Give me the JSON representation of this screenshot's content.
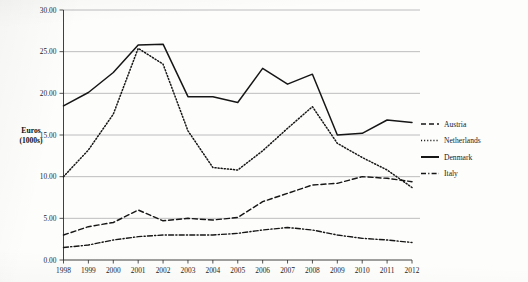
{
  "chart_data": {
    "type": "line",
    "title": "",
    "xlabel": "",
    "ylabel": "Euros (1000s)",
    "ylabel_line1": "Euros",
    "ylabel_line2": "(1000s)",
    "grid": true,
    "legend_position": "right",
    "ylim": [
      0,
      30
    ],
    "ytick_step": 5,
    "ytick_labels": [
      "0.00",
      "5.00",
      "10.00",
      "15.00",
      "20.00",
      "25.00",
      "30.00"
    ],
    "ytick_values": [
      0,
      5,
      10,
      15,
      20,
      25,
      30
    ],
    "categories": [
      "1998",
      "1999",
      "2000",
      "2001",
      "2002",
      "2003",
      "2004",
      "2005",
      "2006",
      "2007",
      "2008",
      "2009",
      "2010",
      "2011",
      "2012"
    ],
    "series": [
      {
        "name": "Austria",
        "style": "dashed",
        "dash": "5,3",
        "width": 1.45,
        "color": "#161616",
        "values": [
          3.0,
          4.0,
          4.5,
          6.0,
          4.7,
          5.0,
          4.8,
          5.1,
          7.0,
          8.0,
          9.0,
          9.2,
          10.0,
          9.8,
          9.4
        ]
      },
      {
        "name": "Netherlands",
        "style": "dotted",
        "dash": "1.1,2.0",
        "width": 1.5,
        "color": "#161616",
        "values": [
          10.0,
          13.2,
          17.5,
          25.4,
          23.5,
          15.5,
          11.1,
          10.8,
          13.1,
          15.8,
          18.4,
          14.0,
          12.3,
          10.8,
          8.7
        ]
      },
      {
        "name": "Denmark",
        "style": "solid",
        "dash": "none",
        "width": 1.5,
        "color": "#161616",
        "values": [
          18.5,
          20.1,
          22.5,
          25.8,
          25.9,
          19.6,
          19.6,
          18.9,
          23.0,
          21.1,
          22.3,
          15.0,
          15.2,
          16.8,
          16.5
        ]
      },
      {
        "name": "Italy",
        "style": "dash-dot",
        "dash": "5,2.2,1.2,2.2",
        "width": 1.4,
        "color": "#161616",
        "values": [
          1.5,
          1.8,
          2.4,
          2.8,
          3.0,
          3.0,
          3.0,
          3.2,
          3.6,
          3.9,
          3.6,
          3.0,
          2.6,
          2.4,
          2.1
        ]
      }
    ],
    "legend_entries": [
      {
        "label": "Austria",
        "dash": "5,3",
        "width": 1.45
      },
      {
        "label": "Netherlands",
        "dash": "1.1,2.0",
        "width": 1.5
      },
      {
        "label": "Denmark",
        "dash": "none",
        "width": 2.0
      },
      {
        "label": "Italy",
        "dash": "5,2.2,1.2,2.2",
        "width": 1.4
      }
    ]
  }
}
